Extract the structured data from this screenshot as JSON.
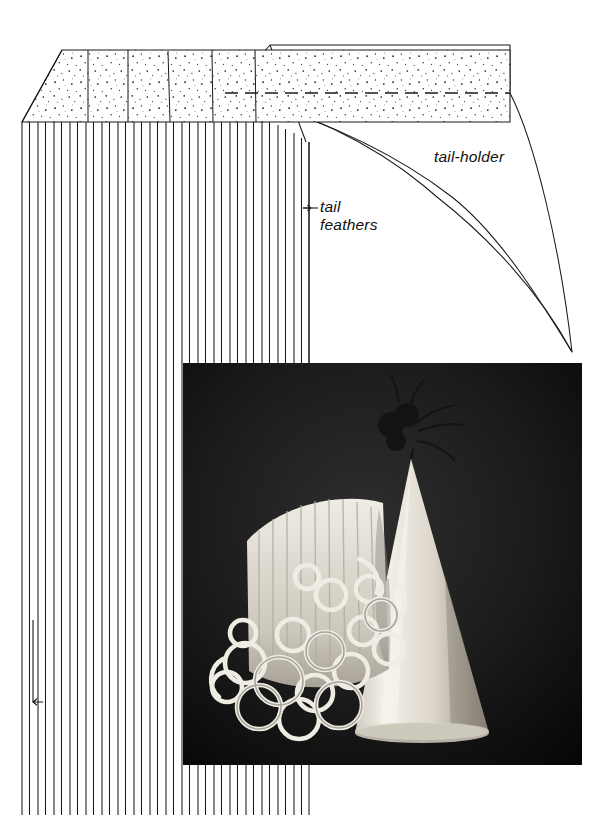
{
  "page": {
    "width": 608,
    "height": 815,
    "background": "#ffffff",
    "ink": "#1a1a1a"
  },
  "diagram": {
    "title_absent": true,
    "labels": {
      "tail_holder": "tail-holder",
      "tail_feathers": "tail\nfeathers"
    },
    "parts": [
      {
        "name": "tail-feathers",
        "description": "rectangular paper strip with stippled glue band across the top and a deep vertical fringe cut below",
        "stipple_band": {
          "left": 22,
          "right": 510,
          "top": 50,
          "bottom": 122,
          "corner_bevel": "top-left diagonal from (62,50) to (22,122)",
          "divider_line_x": [
            88,
            128,
            168,
            212,
            255
          ],
          "dashed_fold_line_y": 93,
          "dashed_fold_from_x": 225,
          "dashed_fold_to_x": 510,
          "fill": "#ffffff",
          "stipple_color": "#1a1a1a"
        },
        "fringe": {
          "top_y": 122,
          "bottom_y": 815,
          "first_x": 22,
          "spacing": 8.1,
          "count": 36,
          "right_x": 310
        }
      },
      {
        "name": "tail-holder",
        "description": "curved crescent wedge that tapers to a point at the lower right",
        "apex": [
          572,
          352
        ],
        "top_edge_from": [
          228,
          93
        ],
        "top_edge_to": [
          510,
          93
        ],
        "fill": "#ffffff"
      }
    ],
    "arrows": [
      {
        "name": "tail-feathers-pointer",
        "direction": "left",
        "from": [
          318,
          208
        ],
        "to": [
          300,
          208
        ]
      },
      {
        "name": "grain-direction-arrow",
        "direction": "down",
        "from": [
          33,
          620
        ],
        "to": [
          33,
          712
        ]
      }
    ]
  },
  "photo": {
    "name": "party-hat-photo",
    "caption_absent": true,
    "bounds": {
      "left": 183,
      "top": 363,
      "width": 399,
      "height": 402
    },
    "background": "#121212",
    "subjects": [
      "white conical party hat with a paper tassel pom at the tip",
      "bundle of curled white crepe-paper streamers forming the tail"
    ]
  },
  "colors": {
    "ink": "#1a1a1a",
    "paper": "#ffffff",
    "photo_dark": "#121212",
    "photo_light": "#f2efe8"
  }
}
